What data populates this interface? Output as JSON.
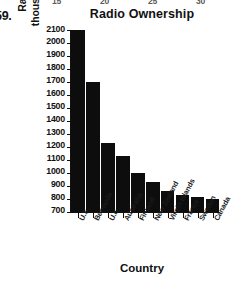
{
  "question_number": "59.",
  "top_clipped_ticks": [
    "15",
    "20",
    "25",
    "30"
  ],
  "chart_data": {
    "type": "bar",
    "title": "Radio Ownership",
    "xlabel": "Country",
    "ylabel_line1": "Radios per",
    "ylabel_line2": "thousand people",
    "ylabel": "Radios per thousand people",
    "categories": [
      "U.S.",
      "Bermuda",
      "U.K.",
      "Australia",
      "Finland",
      "New Zealand",
      "Virgin Islands",
      "France",
      "Sweden",
      "Canada"
    ],
    "values": [
      2100,
      1700,
      1230,
      1130,
      1000,
      930,
      860,
      830,
      815,
      795
    ],
    "ylim": [
      700,
      2100
    ],
    "ytick_labels": [
      "2100",
      "2000",
      "1900",
      "1800",
      "1700",
      "1600",
      "1500",
      "1400",
      "1300",
      "1200",
      "1100",
      "1000",
      "900",
      "800",
      "700"
    ],
    "ytick_values": [
      2100,
      2000,
      1900,
      1800,
      1700,
      1600,
      1500,
      1400,
      1300,
      1200,
      1100,
      1000,
      900,
      800,
      700
    ],
    "grid": false,
    "legend": false,
    "bar_color": "#0d0d0d",
    "axis_color": "#111111",
    "background": "#ffffff"
  }
}
